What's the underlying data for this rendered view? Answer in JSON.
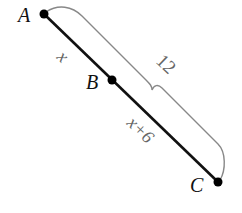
{
  "diagram": {
    "points": [
      {
        "id": "A",
        "label": "A",
        "x": 44,
        "y": 14
      },
      {
        "id": "B",
        "label": "B",
        "x": 112,
        "y": 80
      },
      {
        "id": "C",
        "label": "C",
        "x": 218,
        "y": 182
      }
    ],
    "segments": [
      {
        "from": "A",
        "to": "B",
        "label": "x"
      },
      {
        "from": "B",
        "to": "C",
        "label": "x+6"
      }
    ],
    "brace": {
      "from": "A",
      "to": "C",
      "label": "12"
    },
    "colors": {
      "line": "#111111",
      "brace": "#888888",
      "label": "#666666"
    }
  }
}
